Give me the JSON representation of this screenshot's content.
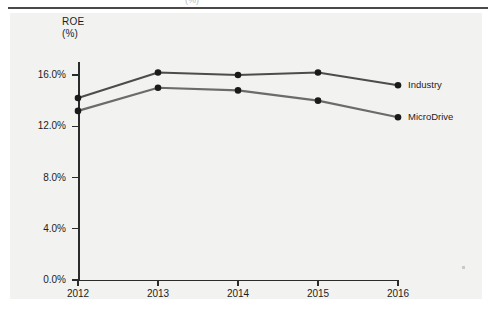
{
  "figure": {
    "clipped_heading": "(%)",
    "axis_title_line1": "ROE",
    "axis_title_line2": "(%)"
  },
  "chart_data": {
    "type": "line",
    "title": "ROE (%)",
    "xlabel": "",
    "ylabel": "ROE (%)",
    "categories": [
      "2012",
      "2013",
      "2014",
      "2015",
      "2016"
    ],
    "x": [
      2012,
      2013,
      2014,
      2015,
      2016
    ],
    "ylim": [
      0.0,
      17.0
    ],
    "xlim": [
      2012,
      2016
    ],
    "ytick_labels": [
      "0.0%",
      "4.0%",
      "8.0%",
      "12.0%",
      "16.0%"
    ],
    "ytick_values": [
      0.0,
      4.0,
      8.0,
      12.0,
      16.0
    ],
    "grid": false,
    "legend_position": "right-inline",
    "series": [
      {
        "name": "Industry",
        "color": "#4c4c4c",
        "values": [
          14.2,
          16.2,
          16.0,
          16.2,
          15.2
        ]
      },
      {
        "name": "MicroDrive",
        "color": "#6b6b6b",
        "values": [
          13.2,
          15.0,
          14.8,
          14.0,
          12.7
        ]
      }
    ]
  },
  "legend": [
    {
      "label": "Industry"
    },
    {
      "label": "MicroDrive"
    }
  ],
  "colors": {
    "panel_background": "#f2f2f0",
    "axis": "#2b2b2b",
    "text": "#1d1d1d",
    "rule": "#4a4a4a"
  }
}
